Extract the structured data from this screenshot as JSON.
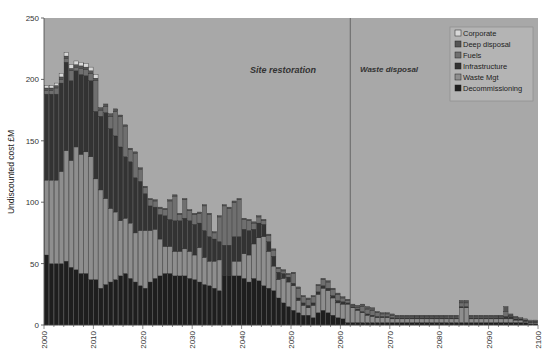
{
  "chart_data": {
    "type": "bar",
    "stacked": true,
    "title": "",
    "xlabel": "",
    "ylabel": "Undiscounted cost £M",
    "ylim": [
      0,
      250
    ],
    "yticks": [
      0,
      50,
      100,
      150,
      200,
      250
    ],
    "xlim": [
      2000,
      2100
    ],
    "xticks": [
      2000,
      2010,
      2020,
      2030,
      2040,
      2050,
      2060,
      2070,
      2080,
      2090,
      2100
    ],
    "grid": false,
    "legend_position": "upper right",
    "annotations": [
      {
        "text": "Site restoration",
        "x": 2025,
        "y": 225
      },
      {
        "text": "Waste disposal",
        "x": 2062,
        "y": 225
      }
    ],
    "vertical_line": {
      "x": 2062
    },
    "series_order_bottom_to_top": [
      "Decommissioning",
      "Waste Mgt",
      "Infrastructure",
      "Fuels",
      "Deep disposal",
      "Corporate"
    ],
    "legend_order": [
      "Corporate",
      "Deep disposal",
      "Fuels",
      "Infrastructure",
      "Waste Mgt",
      "Decommissioning"
    ],
    "colors": {
      "Decommissioning": "#1e1e1e",
      "Waste Mgt": "#8e8e8e",
      "Infrastructure": "#333333",
      "Fuels": "#6f6f6f",
      "Deep disposal": "#555555",
      "Corporate": "#d8d8d8"
    },
    "background": "#a8a8a8",
    "categories": [
      2000,
      2001,
      2002,
      2003,
      2004,
      2005,
      2006,
      2007,
      2008,
      2009,
      2010,
      2011,
      2012,
      2013,
      2014,
      2015,
      2016,
      2017,
      2018,
      2019,
      2020,
      2021,
      2022,
      2023,
      2024,
      2025,
      2026,
      2027,
      2028,
      2029,
      2030,
      2031,
      2032,
      2033,
      2034,
      2035,
      2036,
      2037,
      2038,
      2039,
      2040,
      2041,
      2042,
      2043,
      2044,
      2045,
      2046,
      2047,
      2048,
      2049,
      2050,
      2051,
      2052,
      2053,
      2054,
      2055,
      2056,
      2057,
      2058,
      2059,
      2060,
      2061,
      2062,
      2063,
      2064,
      2065,
      2066,
      2067,
      2068,
      2069,
      2070,
      2071,
      2072,
      2073,
      2074,
      2075,
      2076,
      2077,
      2078,
      2079,
      2080,
      2081,
      2082,
      2083,
      2084,
      2085,
      2086,
      2087,
      2088,
      2089,
      2090,
      2091,
      2092,
      2093,
      2094,
      2095,
      2096,
      2097,
      2098,
      2099
    ],
    "series": [
      {
        "name": "Decommissioning",
        "values": [
          57,
          50,
          50,
          50,
          52,
          47,
          45,
          42,
          42,
          37,
          37,
          30,
          33,
          35,
          37,
          40,
          42,
          38,
          35,
          32,
          30,
          35,
          38,
          40,
          42,
          42,
          40,
          40,
          40,
          38,
          37,
          35,
          33,
          32,
          30,
          28,
          40,
          40,
          40,
          40,
          38,
          35,
          38,
          36,
          32,
          30,
          28,
          22,
          18,
          15,
          12,
          10,
          8,
          8,
          6,
          10,
          12,
          10,
          8,
          6,
          5,
          2,
          2,
          2,
          2,
          2,
          2,
          2,
          2,
          2,
          2,
          2,
          2,
          2,
          2,
          2,
          2,
          2,
          2,
          2,
          2,
          2,
          2,
          2,
          2,
          2,
          2,
          2,
          2,
          2,
          2,
          2,
          2,
          2,
          2,
          2,
          2,
          2,
          1,
          1
        ]
      },
      {
        "name": "Waste Mgt",
        "values": [
          61,
          68,
          68,
          75,
          90,
          87,
          100,
          97,
          99,
          100,
          82,
          80,
          70,
          60,
          55,
          45,
          45,
          45,
          40,
          45,
          47,
          42,
          40,
          30,
          22,
          22,
          20,
          20,
          22,
          22,
          20,
          28,
          22,
          20,
          22,
          25,
          0,
          0,
          12,
          12,
          20,
          22,
          28,
          35,
          40,
          30,
          20,
          15,
          20,
          20,
          20,
          10,
          8,
          6,
          10,
          15,
          18,
          18,
          14,
          12,
          12,
          15,
          12,
          10,
          8,
          6,
          5,
          4,
          4,
          4,
          3,
          3,
          3,
          3,
          3,
          3,
          3,
          3,
          3,
          3,
          3,
          3,
          3,
          3,
          12,
          12,
          3,
          3,
          3,
          3,
          3,
          3,
          3,
          3,
          3,
          2,
          2,
          1,
          1,
          1
        ]
      },
      {
        "name": "Infrastructure",
        "values": [
          70,
          70,
          70,
          72,
          72,
          65,
          62,
          65,
          62,
          62,
          55,
          60,
          70,
          65,
          62,
          60,
          50,
          50,
          45,
          40,
          30,
          20,
          18,
          20,
          25,
          22,
          25,
          25,
          25,
          25,
          25,
          20,
          22,
          20,
          18,
          15,
          25,
          25,
          20,
          20,
          20,
          20,
          12,
          12,
          10,
          8,
          8,
          6,
          4,
          4,
          2,
          2,
          2,
          2,
          2,
          2,
          2,
          2,
          2,
          2,
          2,
          1,
          1,
          1,
          1,
          1,
          1,
          1,
          1,
          1,
          1,
          1,
          1,
          1,
          1,
          1,
          1,
          1,
          1,
          1,
          1,
          1,
          1,
          1,
          1,
          1,
          1,
          1,
          1,
          1,
          1,
          1,
          1,
          2,
          2,
          1,
          1,
          1,
          1,
          1
        ]
      },
      {
        "name": "Fuels",
        "values": [
          3,
          3,
          5,
          3,
          3,
          8,
          3,
          5,
          5,
          6,
          25,
          5,
          5,
          10,
          20,
          25,
          25,
          10,
          20,
          10,
          5,
          5,
          5,
          5,
          5,
          15,
          20,
          5,
          15,
          8,
          8,
          8,
          20,
          18,
          5,
          20,
          32,
          30,
          28,
          30,
          8,
          8,
          5,
          5,
          3,
          5,
          5,
          3,
          2,
          2,
          8,
          8,
          5,
          5,
          5,
          5,
          5,
          5,
          5,
          5,
          3,
          2,
          1,
          1,
          4,
          4,
          4,
          3,
          2,
          2,
          2,
          1,
          1,
          1,
          1,
          1,
          1,
          1,
          1,
          1,
          1,
          1,
          1,
          1,
          3,
          3,
          1,
          1,
          1,
          1,
          1,
          1,
          1,
          4,
          1,
          1,
          1,
          1,
          1,
          1
        ]
      },
      {
        "name": "Deep disposal",
        "values": [
          2,
          2,
          2,
          2,
          2,
          2,
          2,
          2,
          2,
          2,
          2,
          2,
          2,
          2,
          2,
          1,
          1,
          1,
          1,
          1,
          1,
          1,
          1,
          1,
          1,
          1,
          1,
          1,
          1,
          1,
          1,
          1,
          1,
          1,
          1,
          1,
          1,
          1,
          1,
          1,
          1,
          1,
          1,
          1,
          1,
          1,
          1,
          1,
          1,
          1,
          1,
          1,
          1,
          1,
          1,
          1,
          1,
          1,
          1,
          1,
          1,
          1,
          1,
          2,
          2,
          2,
          2,
          1,
          1,
          1,
          1,
          1,
          1,
          1,
          1,
          1,
          1,
          1,
          1,
          1,
          1,
          1,
          1,
          1,
          2,
          2,
          1,
          1,
          1,
          1,
          1,
          1,
          1,
          4,
          1,
          1,
          0,
          0,
          0,
          0
        ]
      },
      {
        "name": "Corporate",
        "values": [
          2,
          2,
          2,
          3,
          3,
          3,
          3,
          3,
          3,
          3,
          3,
          0,
          0,
          0,
          0,
          0,
          0,
          0,
          0,
          0,
          0,
          0,
          0,
          0,
          0,
          0,
          0,
          0,
          0,
          0,
          0,
          0,
          0,
          0,
          0,
          0,
          0,
          0,
          0,
          0,
          0,
          0,
          0,
          0,
          0,
          0,
          0,
          0,
          0,
          0,
          0,
          0,
          0,
          0,
          0,
          0,
          0,
          0,
          0,
          0,
          0,
          0,
          0,
          0,
          0,
          0,
          0,
          0,
          0,
          0,
          0,
          0,
          0,
          0,
          0,
          0,
          0,
          0,
          0,
          0,
          0,
          0,
          0,
          0,
          0,
          0,
          0,
          0,
          0,
          0,
          0,
          0,
          0,
          0,
          0,
          0,
          0,
          0,
          0,
          0
        ]
      }
    ]
  }
}
